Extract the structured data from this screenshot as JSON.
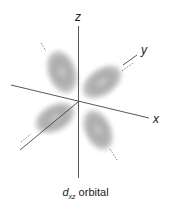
{
  "diagram": {
    "caption": {
      "symbol": "d",
      "subscript": "xz",
      "text": "orbital"
    },
    "axes": [
      {
        "name": "x",
        "label": "x"
      },
      {
        "name": "y",
        "label": "y"
      },
      {
        "name": "z",
        "label": "z"
      }
    ],
    "lobes": 4,
    "colors": {
      "lobe": "#9a9a9a",
      "axis": "#333333",
      "background": "#ffffff"
    }
  }
}
